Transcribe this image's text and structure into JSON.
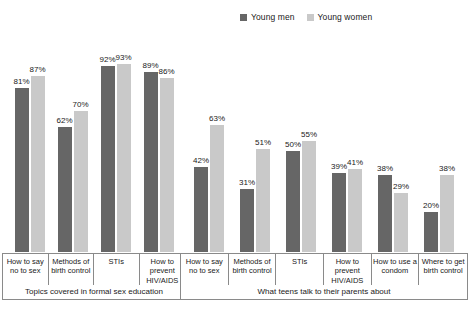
{
  "legend": {
    "entries": [
      {
        "label": "Young men",
        "color": "#666666",
        "icon": "legend-swatch-icon"
      },
      {
        "label": "Young women",
        "color": "#c9c9c9",
        "icon": "legend-swatch-icon"
      }
    ]
  },
  "chart_data": {
    "type": "bar",
    "title": "",
    "subtitle": "",
    "xlabel": "",
    "ylabel": "",
    "ylim": [
      0,
      100
    ],
    "grid": false,
    "legend_position": "top-right",
    "value_suffix": "%",
    "categories": [
      "How to say no to sex",
      "Methods of birth control",
      "STIs",
      "How to prevent HIV/AIDS",
      "How to say no to sex",
      "Methods of birth control",
      "STIs",
      "How to prevent HIV/AIDS",
      "How to use a condom",
      "Where to get birth control"
    ],
    "series": [
      {
        "name": "Young men",
        "color": "#666666",
        "values": [
          81,
          62,
          92,
          89,
          42,
          31,
          50,
          39,
          38,
          20
        ]
      },
      {
        "name": "Young women",
        "color": "#c9c9c9",
        "values": [
          87,
          70,
          93,
          86,
          63,
          51,
          55,
          41,
          29,
          38
        ]
      }
    ],
    "groups": [
      {
        "caption": "Topics covered in formal sex education",
        "category_indices": [
          0,
          1,
          2,
          3
        ]
      },
      {
        "caption": "What teens talk to their parents about",
        "category_indices": [
          4,
          5,
          6,
          7,
          8,
          9
        ]
      }
    ],
    "bar_labels": [
      {
        "series": "Young men",
        "values": [
          "81%",
          "62%",
          "92%",
          "89%",
          "42%",
          "31%",
          "50%",
          "39%",
          "38%",
          "20%"
        ]
      },
      {
        "series": "Young women",
        "values": [
          "87%",
          "70%",
          "93%",
          "86%",
          "63%",
          "51%",
          "55%",
          "41%",
          "29%",
          "38%"
        ]
      }
    ]
  },
  "labels": {
    "group1": {
      "caption": "Topics covered in formal sex education",
      "cells": [
        "How to say no to sex",
        "Methods of birth control",
        "STIs",
        "How to prevent HIV/AIDS"
      ]
    },
    "group2": {
      "caption": "What teens talk to their parents about",
      "cells": [
        "How to say no to sex",
        "Methods of birth control",
        "STIs",
        "How to prevent HIV/AIDS",
        "How to use a condom",
        "Where to get birth control"
      ]
    }
  }
}
